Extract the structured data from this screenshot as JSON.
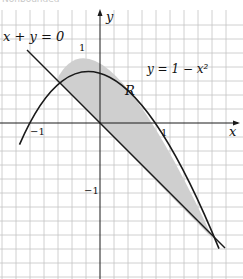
{
  "header": {
    "cut_text": "Nonbounded"
  },
  "diagram": {
    "axes": {
      "x_label": "x",
      "y_label": "y"
    },
    "ticks": {
      "x_pos": "1",
      "x_neg": "−1",
      "y_pos": "1",
      "y_neg": "−1"
    },
    "curves": {
      "parabola_label": "y = 1 − x²",
      "line_label": "x + y = 0"
    },
    "region_label": "R",
    "colors": {
      "grid": "#bdbdbd",
      "curve": "#1a1a1a",
      "region_fill": "#cfcfcf",
      "axis": "#1a1a1a"
    },
    "intersections": [
      {
        "x": -0.618,
        "y": 0.618
      },
      {
        "x": 1.618,
        "y": -1.618
      }
    ]
  }
}
